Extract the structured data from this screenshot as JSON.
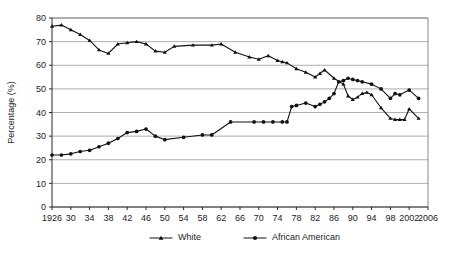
{
  "chart_data": {
    "type": "line",
    "title": "",
    "xlabel": "",
    "ylabel": "Percentage (%)",
    "ylim": [
      0,
      80
    ],
    "xlim": [
      1926,
      2006
    ],
    "grid": true,
    "legend_position": "bottom",
    "y_ticks": [
      0,
      10,
      20,
      30,
      40,
      50,
      60,
      70,
      80
    ],
    "x_ticks": [
      1926,
      1930,
      1934,
      1938,
      1942,
      1946,
      1950,
      1954,
      1958,
      1962,
      1966,
      1970,
      1974,
      1978,
      1982,
      1986,
      1990,
      1994,
      1998,
      2002,
      2006
    ],
    "x_tick_labels": [
      "1926",
      "30",
      "34",
      "38",
      "42",
      "46",
      "50",
      "54",
      "58",
      "62",
      "66",
      "70",
      "74",
      "78",
      "82",
      "86",
      "90",
      "94",
      "98",
      "2002",
      "2006"
    ],
    "series": [
      {
        "name": "White",
        "marker": "triangle",
        "color": "#111111",
        "x": [
          1926,
          1928,
          1930,
          1932,
          1934,
          1936,
          1938,
          1940,
          1942,
          1944,
          1946,
          1948,
          1950,
          1952,
          1956,
          1960,
          1962,
          1965,
          1968,
          1970,
          1972,
          1974,
          1975,
          1976,
          1978,
          1980,
          1982,
          1983,
          1984,
          1986,
          1988,
          1989,
          1990,
          1991,
          1992,
          1993,
          1994,
          1996,
          1998,
          1999,
          2000,
          2001,
          2002,
          2004
        ],
        "values": [
          76.5,
          77.0,
          75.0,
          73.0,
          70.5,
          66.5,
          65.0,
          69.0,
          69.5,
          70.0,
          69.0,
          66.0,
          65.5,
          68.0,
          68.5,
          68.5,
          69.0,
          65.5,
          63.5,
          62.5,
          64.0,
          62.0,
          61.5,
          61.0,
          58.5,
          57.0,
          55.0,
          56.5,
          58.0,
          54.5,
          52.0,
          47.0,
          45.5,
          46.5,
          48.0,
          48.5,
          47.5,
          42.0,
          37.5,
          37.0,
          37.0,
          37.0,
          41.5,
          37.5
        ]
      },
      {
        "name": "African American",
        "marker": "circle",
        "color": "#111111",
        "x": [
          1926,
          1928,
          1930,
          1932,
          1934,
          1936,
          1938,
          1940,
          1942,
          1944,
          1946,
          1948,
          1950,
          1954,
          1958,
          1960,
          1964,
          1969,
          1971,
          1973,
          1975,
          1976,
          1977,
          1978,
          1980,
          1982,
          1983,
          1984,
          1985,
          1986,
          1987,
          1988,
          1989,
          1990,
          1991,
          1992,
          1994,
          1996,
          1998,
          1999,
          2000,
          2002,
          2004
        ],
        "values": [
          22.0,
          22.0,
          22.5,
          23.5,
          24.0,
          25.5,
          27.0,
          29.0,
          31.5,
          32.0,
          33.0,
          30.0,
          28.5,
          29.5,
          30.5,
          30.5,
          36.0,
          36.0,
          36.0,
          36.0,
          36.0,
          36.0,
          42.5,
          43.0,
          44.0,
          42.5,
          43.5,
          44.5,
          46.0,
          48.0,
          53.0,
          53.5,
          54.5,
          54.0,
          53.5,
          53.0,
          52.0,
          50.0,
          46.0,
          48.0,
          47.5,
          49.5,
          46.0
        ]
      }
    ],
    "legend": [
      {
        "label": "White",
        "marker": "triangle"
      },
      {
        "label": "African American",
        "marker": "circle"
      }
    ]
  }
}
